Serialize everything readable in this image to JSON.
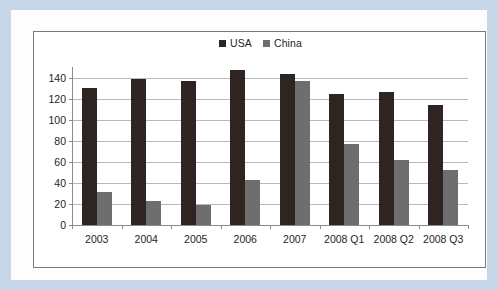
{
  "chart_data": {
    "type": "bar",
    "title": "",
    "xlabel": "",
    "ylabel": "",
    "ylim": [
      0,
      150
    ],
    "yticks": [
      0,
      20,
      40,
      60,
      80,
      100,
      120,
      140
    ],
    "grid": true,
    "legend_position": "top-center",
    "categories": [
      "2003",
      "2004",
      "2005",
      "2006",
      "2007",
      "2008 Q1",
      "2008 Q2",
      "2008 Q3"
    ],
    "series": [
      {
        "name": "USA",
        "color": "#2e2522",
        "values": [
          130,
          139,
          137,
          147,
          143,
          124,
          126,
          114
        ]
      },
      {
        "name": "China",
        "color": "#6e6e6e",
        "values": [
          31,
          23,
          19,
          43,
          137,
          77,
          62,
          52
        ]
      }
    ]
  },
  "legend": {
    "items": [
      {
        "label": "USA",
        "marker": "square-marker-icon"
      },
      {
        "label": "China",
        "marker": "square-marker-icon"
      }
    ]
  },
  "colors": {
    "usa": "#2e2522",
    "china": "#6e6e6e",
    "gridline": "#b9b9b9",
    "axis": "#8a8a8a",
    "page_border": "#c7d6e8",
    "chart_border": "#777b7e",
    "text": "#231f1d"
  }
}
